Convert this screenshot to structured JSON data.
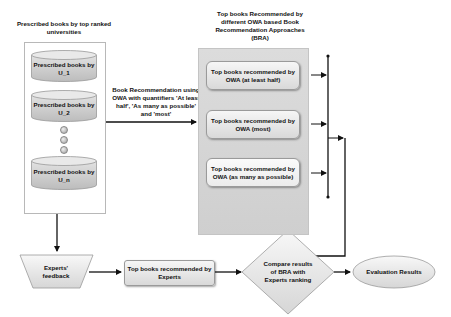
{
  "diagram": {
    "universities_title": "Prescribed books by top ranked universities",
    "universities": [
      {
        "label": "Prescribed books by U_1"
      },
      {
        "label": "Prescribed books by U_2"
      },
      {
        "label": "Prescribed books by U_n"
      }
    ],
    "ellipsis_dots": 3,
    "recommendation_edge_label": "Book Recommendation using OWA with quantifiers 'At least half', 'As many as possible' and 'most'",
    "bra_title": "Top books Recommended by different OWA based Book Recommendation Approaches (BRA)",
    "bra_boxes": [
      {
        "label": "Top books recommended by OWA (at least half)"
      },
      {
        "label": "Top books recommended by OWA (most)"
      },
      {
        "label": "Top books recommended by OWA (as many as possible)"
      }
    ],
    "experts_feedback": "Experts' feedback",
    "experts_top_books": "Top books recommended by Experts",
    "compare": "Compare results of BRA with Experts ranking",
    "evaluation": "Evaluation Results"
  }
}
